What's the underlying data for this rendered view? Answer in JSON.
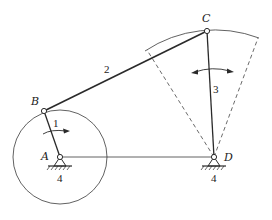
{
  "colors": {
    "stroke": "#2a2a2a",
    "dashed": "#444444",
    "background": "#ffffff"
  },
  "points": {
    "A": {
      "label": "A",
      "x": 60,
      "y": 157
    },
    "B": {
      "label": "B",
      "x": 44,
      "y": 111
    },
    "C": {
      "label": "C",
      "x": 207,
      "y": 31
    },
    "D": {
      "label": "D",
      "x": 214,
      "y": 157
    }
  },
  "links": {
    "crank": {
      "number": "1",
      "from": "A",
      "to": "B"
    },
    "coupler": {
      "number": "2",
      "from": "B",
      "to": "C"
    },
    "rocker": {
      "number": "3",
      "from": "D",
      "to": "C"
    },
    "frame": {
      "number": "4",
      "from": "A",
      "to": "D"
    }
  },
  "ground_labels": {
    "A": "4",
    "D": "4"
  },
  "crank_circle": {
    "center": "A",
    "radius": 47
  },
  "rocker_arc": {
    "center": "D",
    "radius": 126,
    "left_end": [
      147,
      50
    ],
    "right_end": [
      258,
      38
    ]
  },
  "motion": {
    "crank": "rotation",
    "rocker": "oscillation"
  }
}
